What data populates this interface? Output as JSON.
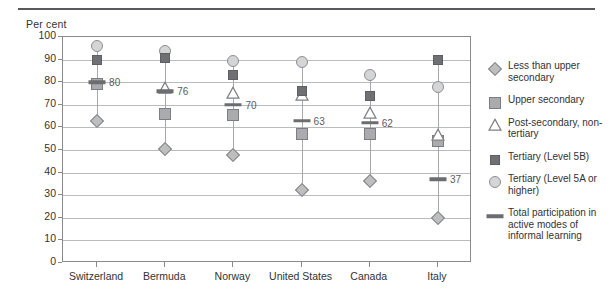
{
  "chart_data": {
    "type": "scatter",
    "title": "",
    "ylabel": "Per cent",
    "xlabel": "",
    "ylim": [
      0,
      100
    ],
    "ytick_labels": [
      "0",
      "10",
      "20",
      "30",
      "40",
      "50",
      "60",
      "70",
      "80",
      "90",
      "100"
    ],
    "yticks": [
      0,
      10,
      20,
      30,
      40,
      50,
      60,
      70,
      80,
      90,
      100
    ],
    "grid": true,
    "legend_position": "right",
    "categories": [
      "Switzerland",
      "Bermuda",
      "Norway",
      "United States",
      "Canada",
      "Italy"
    ],
    "series": [
      {
        "name": "Less than upper secondary",
        "marker": "diamond",
        "values": [
          63,
          50.5,
          48,
          32.5,
          36.5,
          20
        ]
      },
      {
        "name": "Upper secondary",
        "marker": "square-light",
        "values": [
          79,
          66,
          65.5,
          57,
          57,
          54
        ]
      },
      {
        "name": "Post-secondary, non-tertiary",
        "marker": "triangle",
        "values": [
          null,
          77,
          75,
          74,
          66,
          56
        ]
      },
      {
        "name": "Tertiary (Level 5B)",
        "marker": "square-dark",
        "values": [
          90,
          90.5,
          83,
          76,
          74,
          90
        ]
      },
      {
        "name": "Tertiary (Level 5A or higher)",
        "marker": "circle",
        "values": [
          96,
          94,
          89.5,
          89,
          83,
          78
        ]
      },
      {
        "name": "Total participation in active modes of informal learning",
        "marker": "dash",
        "values": [
          80,
          76,
          70,
          63,
          62,
          37
        ]
      }
    ],
    "point_labels": [
      "80",
      "76",
      "70",
      "63",
      "62",
      "37"
    ]
  },
  "legend": {
    "items": [
      {
        "icon": "diamond-marker-icon",
        "label": "Less than upper secondary"
      },
      {
        "icon": "light-square-marker-icon",
        "label": "Upper secondary"
      },
      {
        "icon": "triangle-marker-icon",
        "label": "Post-secondary, non-tertiary"
      },
      {
        "icon": "dark-square-marker-icon",
        "label": "Tertiary (Level 5B)"
      },
      {
        "icon": "circle-marker-icon",
        "label": "Tertiary (Level 5A or higher)"
      },
      {
        "icon": "dash-marker-icon",
        "label": "Total participation in active modes of informal learning"
      }
    ]
  },
  "colors": {
    "grid": "#b9bcbe",
    "axis": "#8a8a8a",
    "rule": "#58595b",
    "circle": "#d4d5d7",
    "square_light": "#a9abae",
    "square_dark": "#6e7073",
    "diamond": "#bcbec0",
    "dash": "#6b6d70",
    "text": "#333333"
  }
}
